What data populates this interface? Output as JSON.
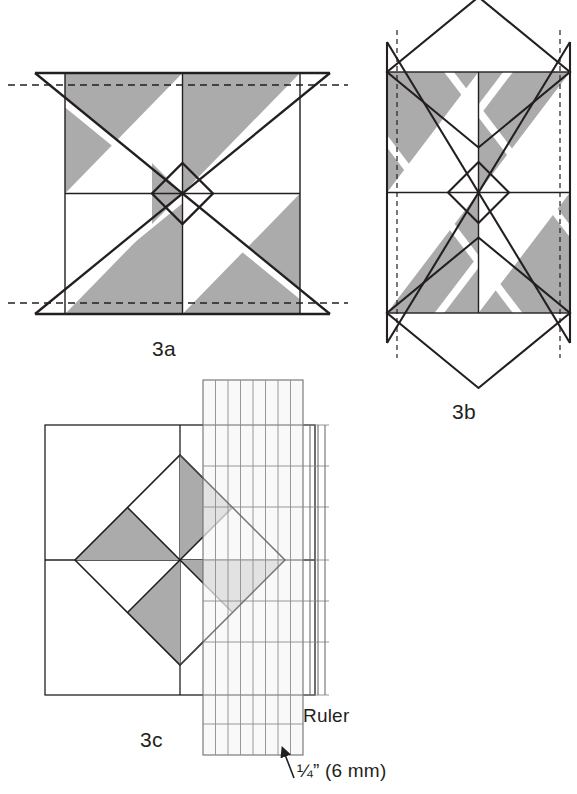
{
  "page": {
    "background_color": "#ffffff",
    "width": 577,
    "height": 794
  },
  "colors": {
    "line": "#231f20",
    "shade_gray": "#ababab",
    "shade_gray_light": "#c2c2c2",
    "dashed_guide": "#231f20",
    "ruler_grid": "#8c8c8c",
    "ruler_fill": "#fbfbfb",
    "text": "#231f20"
  },
  "figures": [
    {
      "id": "3a",
      "label": "3a",
      "description": "Pinwheel block square with overlaid large X diagonals extending past the block, horizontal dashed trim guidelines at top and bottom",
      "label_position": {
        "x": 152,
        "y": 337
      },
      "block": {
        "left": 65,
        "top": 73,
        "right": 300,
        "bottom": 314,
        "center_x": 182.5,
        "center_y": 193.5
      },
      "guides": [
        {
          "type": "dashed-horizontal",
          "y": 85,
          "x1": 8,
          "x2": 348
        },
        {
          "type": "dashed-horizontal",
          "y": 303,
          "x1": 8,
          "x2": 348
        }
      ],
      "overlay": {
        "type": "flying-geese-rectangle",
        "left": 35,
        "right": 330,
        "top": 73,
        "bottom": 314
      }
    },
    {
      "id": "3b",
      "label": "3b",
      "description": "Same block rotated 90 degrees: tall rectangle overlay with diamond points above and below, vertical dashed trim guidelines at left and right",
      "label_position": {
        "x": 452,
        "y": 400
      },
      "block": {
        "left": 387,
        "top": 72,
        "right": 570,
        "bottom": 313,
        "center_x": 478.5,
        "center_y": 192.5
      },
      "guides": [
        {
          "type": "dashed-vertical",
          "x": 397,
          "y1": 30,
          "y2": 358
        },
        {
          "type": "dashed-vertical",
          "x": 560,
          "y1": 30,
          "y2": 358
        }
      ],
      "overlay": {
        "type": "flying-geese-rectangle-rotated",
        "left": 387,
        "right": 570,
        "top": -3,
        "bottom": 388
      }
    },
    {
      "id": "3c",
      "label": "3c",
      "description": "Trimming step: square block with rotated pinwheel on point, transparent gridded ruler laid over the right portion, arrow marking the quarter inch seam allowance",
      "label_position": {
        "x": 140,
        "y": 728
      },
      "block": {
        "left": 45,
        "top": 425,
        "right": 315,
        "bottom": 695,
        "center_x": 180,
        "center_y": 560
      },
      "diamond_half_diagonal": 105
    }
  ],
  "ruler": {
    "label": "Ruler",
    "label_position": {
      "x": 303,
      "y": 705
    },
    "left": 203,
    "top": 380,
    "right": 303,
    "bottom": 755,
    "columns": 8,
    "rows": 9,
    "edge_strips": 2
  },
  "annotation": {
    "seam_allowance_label": "¼” (6 mm)",
    "seam_allowance_position": {
      "x": 297,
      "y": 760
    },
    "arrow": {
      "from_x": 294,
      "from_y": 775,
      "to_x": 285,
      "to_y": 750
    }
  },
  "labels": {
    "fig_3a": "3a",
    "fig_3b": "3b",
    "fig_3c": "3c",
    "ruler": "Ruler",
    "seam": "¼” (6 mm)"
  }
}
